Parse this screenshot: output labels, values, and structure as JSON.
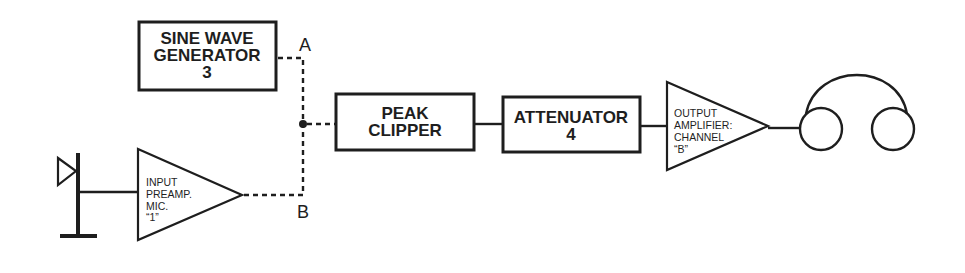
{
  "diagram": {
    "blocks": {
      "sine_generator": {
        "lines": [
          "SINE WAVE",
          "GENERATOR",
          "3"
        ]
      },
      "peak_clipper": {
        "lines": [
          "PEAK",
          "CLIPPER"
        ]
      },
      "attenuator": {
        "lines": [
          "ATTENUATOR",
          "4"
        ]
      },
      "input_preamp": {
        "lines": [
          "INPUT",
          "PREAMP.",
          "MIC.",
          "“1”"
        ]
      },
      "output_amplifier": {
        "lines": [
          "OUTPUT",
          "AMPLIFIER:",
          "CHANNEL",
          "“B”"
        ]
      }
    },
    "points": {
      "a": "A",
      "b": "B"
    },
    "icons": [
      "microphone-icon",
      "headphones-icon"
    ],
    "colors": {
      "ink": "#1e1e1e",
      "background": "#ffffff"
    }
  }
}
